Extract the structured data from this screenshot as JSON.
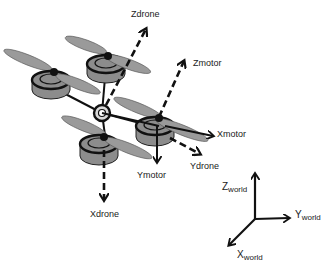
{
  "diagram": {
    "title": "",
    "colors": {
      "background": "#ffffff",
      "ink": "#111111",
      "motor_fill": "#8c8c8c",
      "propeller_fill": "#9a9a9a"
    },
    "drone": {
      "motors": [
        {
          "id": "motor-back-left",
          "cx": 50,
          "cy": 82
        },
        {
          "id": "motor-back-right",
          "cx": 106,
          "cy": 66
        },
        {
          "id": "motor-right",
          "cx": 155,
          "cy": 127
        },
        {
          "id": "motor-front",
          "cx": 106,
          "cy": 143
        }
      ],
      "hub": {
        "cx": 102,
        "cy": 113
      }
    },
    "labels": {
      "zdrone": "Zdrone",
      "zmotor": "Zmotor",
      "xmotor": "Xmotor",
      "ydrone": "Ydrone",
      "ymotor": "Ymotor",
      "xdrone": "Xdrone",
      "zworld_main": "Z",
      "zworld_sub": "world",
      "yworld_main": "Y",
      "yworld_sub": "world",
      "xworld_main": "X",
      "xworld_sub": "world"
    },
    "axes": {
      "drone_frame": [
        "Xdrone",
        "Ydrone",
        "Zdrone"
      ],
      "motor_frame": [
        "Xmotor",
        "Ymotor",
        "Zmotor"
      ],
      "world_frame": [
        "Xworld",
        "Yworld",
        "Zworld"
      ]
    }
  }
}
